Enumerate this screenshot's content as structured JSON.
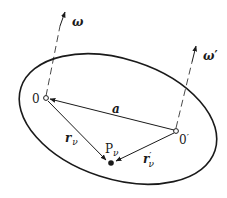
{
  "diagram": {
    "labels": {
      "omega": "ω",
      "omega_prime": "ω",
      "omega_prime_mark": "′",
      "origin_O": "0",
      "origin_O_prime": "0",
      "origin_O_prime_mark": "′",
      "vector_a": "a",
      "r_nu": "r",
      "r_nu_sub": "ν",
      "r_nu_prime": "r",
      "r_nu_prime_mark": "′",
      "r_nu_prime_sub": "ν",
      "point_P": "P",
      "point_P_sub": "ν"
    },
    "colors": {
      "ink": "#1a1a1a",
      "background": "#ffffff"
    }
  }
}
